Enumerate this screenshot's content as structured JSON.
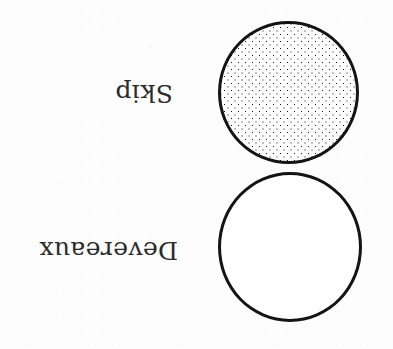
{
  "figure": {
    "type": "diagram",
    "background_color": "#fdfdfd",
    "ink_color": "#141414",
    "text_color": "#2b2b2b",
    "orientation": "rotated-180",
    "labels": [
      {
        "id": "skip",
        "text": "Skip",
        "rotation_degrees": 180
      },
      {
        "id": "devereaux",
        "text": "Devereaux",
        "rotation_degrees": 180
      }
    ],
    "shapes": [
      {
        "id": "stippled-circle",
        "kind": "circle",
        "fill": "stippled-dots",
        "fill_color": "#ffffff",
        "dot_color": "#141414",
        "stroke_color": "#141414",
        "stroke_width_px": 3,
        "associated_label": "Skip"
      },
      {
        "id": "open-circle",
        "kind": "circle",
        "fill": "none",
        "fill_color": "#ffffff",
        "stroke_color": "#141414",
        "stroke_width_px": 3,
        "associated_label": "Devereaux"
      }
    ]
  }
}
